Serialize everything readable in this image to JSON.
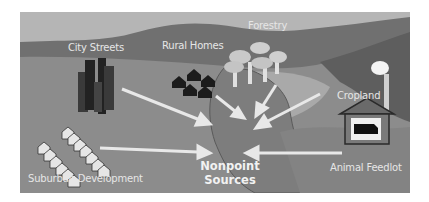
{
  "diagram": {
    "title": "Nonpoint Sources",
    "center_label_line1": "Nonpoint",
    "center_label_line2": "Sources",
    "sources": [
      {
        "label": "City Streets"
      },
      {
        "label": "Rural Homes"
      },
      {
        "label": "Forestry"
      },
      {
        "label": "Cropland"
      },
      {
        "label": "Animal Feedlot"
      },
      {
        "label": "Suburban Development"
      }
    ],
    "colors": {
      "sky": "#b9b9b9",
      "hills": "#6f6f6f",
      "ground": "#8e8e8e",
      "arrows": "#e8e8e8",
      "label_text": "#e6e6e6"
    }
  }
}
